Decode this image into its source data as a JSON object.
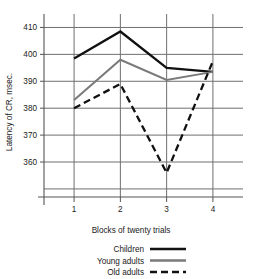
{
  "chart_data": {
    "type": "line",
    "title": "",
    "xlabel": "Blocks of twenty trials",
    "ylabel": "Latency of CR, msec.",
    "categories": [
      "1",
      "2",
      "3",
      "4"
    ],
    "x": [
      1,
      2,
      3,
      4
    ],
    "xlim": [
      0.35,
      4.65
    ],
    "ylim": [
      347,
      415
    ],
    "ytick_labels": [
      "410",
      "400",
      "390",
      "380",
      "370",
      "360"
    ],
    "ytick_values": [
      410,
      400,
      390,
      380,
      370,
      360
    ],
    "xtick_labels": [
      "1",
      "2",
      "3",
      "4"
    ],
    "grid": "both",
    "legend_position": "bottom",
    "series": [
      {
        "name": "Children",
        "values": [
          398.5,
          408.5,
          395.0,
          393.5
        ],
        "color": "#111111",
        "style": "solid",
        "width": 2.3
      },
      {
        "name": "Young adults",
        "values": [
          383.0,
          398.0,
          390.5,
          393.5
        ],
        "color": "#7a7a7a",
        "style": "solid",
        "width": 2.0
      },
      {
        "name": "Old adults",
        "values": [
          380.0,
          389.0,
          356.0,
          397.5
        ],
        "color": "#111111",
        "style": "dashed",
        "width": 2.3
      }
    ]
  },
  "legend": {
    "items": [
      {
        "label": "Children"
      },
      {
        "label": "Young adults"
      },
      {
        "label": "Old adults"
      }
    ]
  },
  "axes": {
    "y_title": "Latency of CR, msec.",
    "x_title": "Blocks of twenty trials",
    "y_labels": [
      "410",
      "400",
      "390",
      "380",
      "370",
      "360"
    ],
    "x_labels": [
      "1",
      "2",
      "3",
      "4"
    ]
  },
  "colors": {
    "children": "#111111",
    "young_adults": "#7a7a7a",
    "old_adults": "#111111",
    "grid": "#6f6f6f",
    "axis": "#555555",
    "text": "#1a1a1a"
  }
}
